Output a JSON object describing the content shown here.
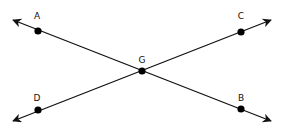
{
  "diagram": {
    "colors": {
      "line": "#111111",
      "point": "#000000",
      "background": "#ffffff"
    },
    "points": [
      {
        "id": "A",
        "label": "A",
        "x": 38,
        "y": 31,
        "lx": 37,
        "ly": 19
      },
      {
        "id": "C",
        "label": "C",
        "x": 241,
        "y": 32,
        "lx": 241,
        "ly": 19
      },
      {
        "id": "G",
        "label": "G",
        "x": 142,
        "y": 71,
        "lx": 142,
        "ly": 63
      },
      {
        "id": "D",
        "label": "D",
        "x": 38,
        "y": 110,
        "lx": 37,
        "ly": 101
      },
      {
        "id": "B",
        "label": "B",
        "x": 241,
        "y": 109,
        "lx": 241,
        "ly": 101
      }
    ],
    "lines": [
      {
        "name": "line-AB",
        "from": [
          13,
          20
        ],
        "to": [
          271,
          121
        ],
        "through": [
          "A",
          "G",
          "B"
        ]
      },
      {
        "name": "line-DC",
        "from": [
          13,
          121
        ],
        "to": [
          271,
          20
        ],
        "through": [
          "D",
          "G",
          "C"
        ]
      }
    ]
  }
}
